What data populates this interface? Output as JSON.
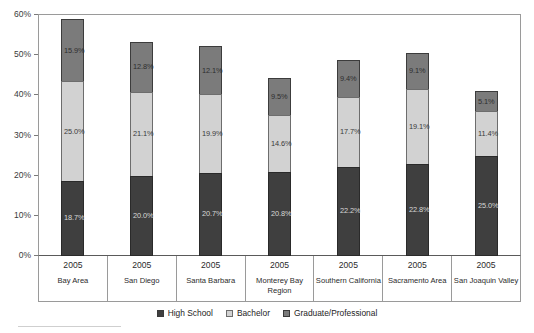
{
  "chart_data": {
    "type": "bar",
    "subtype": "stacked-bar",
    "title": "",
    "xlabel": "",
    "ylabel": "",
    "ylim": [
      0,
      60
    ],
    "y_tick_labels": [
      "0%",
      "10%",
      "20%",
      "30%",
      "40%",
      "50%",
      "60%"
    ],
    "y_tick_values": [
      0,
      10,
      20,
      30,
      40,
      50,
      60
    ],
    "grid": false,
    "legend_position": "bottom-center",
    "categories": [
      "Bay Area",
      "San Diego",
      "Santa Barbara",
      "Monterey Bay Region",
      "Southern California",
      "Sacramento Area",
      "San Joaquin Valley"
    ],
    "category_years": [
      "2005",
      "2005",
      "2005",
      "2005",
      "2005",
      "2005",
      "2005"
    ],
    "series": [
      {
        "name": "High School",
        "color": "#3f3f3f",
        "values": [
          18.7,
          20.0,
          20.7,
          20.8,
          22.2,
          22.8,
          25.0
        ],
        "labels": [
          "18.7%",
          "20.0%",
          "20.7%",
          "20.8%",
          "22.2%",
          "22.8%",
          "25.0%"
        ]
      },
      {
        "name": "Bachelor",
        "color": "#d2d2d2",
        "values": [
          25.0,
          21.1,
          19.9,
          14.6,
          17.7,
          19.1,
          11.4
        ],
        "labels": [
          "25.0%",
          "21.1%",
          "19.9%",
          "14.6%",
          "17.7%",
          "19.1%",
          "11.4%"
        ]
      },
      {
        "name": "Graduate/Professional",
        "color": "#7b7b7b",
        "values": [
          15.9,
          12.8,
          12.1,
          9.5,
          9.4,
          9.1,
          5.1
        ],
        "labels": [
          "15.9%",
          "12.8%",
          "12.1%",
          "9.5%",
          "9.4%",
          "9.1%",
          "5.1%"
        ]
      }
    ],
    "totals": [
      59.6,
      53.9,
      52.7,
      44.9,
      49.3,
      51.0,
      41.5
    ]
  },
  "legend": {
    "items": [
      {
        "label": "High School",
        "swatch": "hs"
      },
      {
        "label": "Bachelor",
        "swatch": "ba"
      },
      {
        "label": "Graduate/Professional",
        "swatch": "gp"
      }
    ]
  }
}
